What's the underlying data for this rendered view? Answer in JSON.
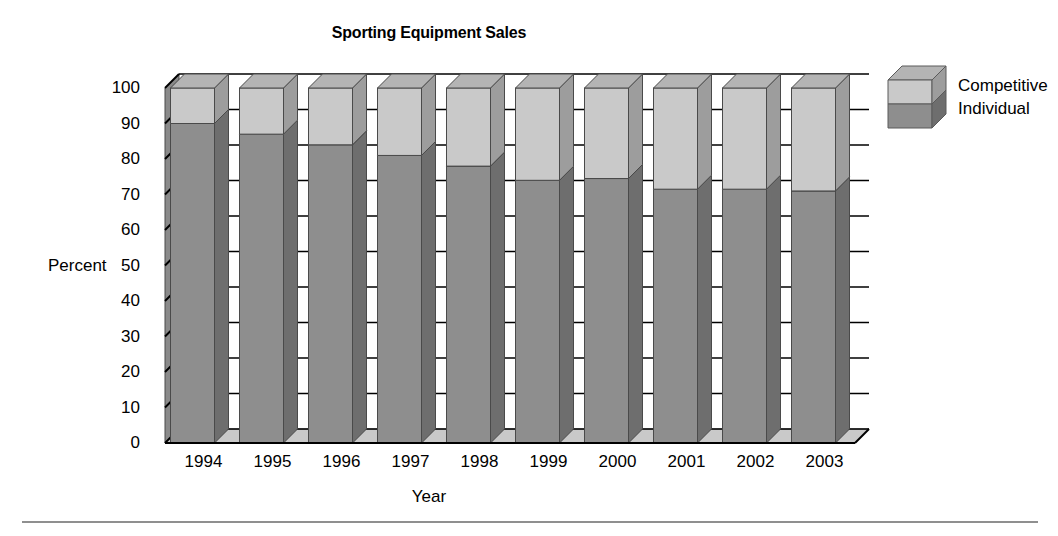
{
  "chart_data": {
    "type": "bar",
    "subtype": "stacked-100-percent-3d-column",
    "title": "Sporting Equipment Sales",
    "xlabel": "Year",
    "ylabel": "Percent",
    "categories": [
      "1994",
      "1995",
      "1996",
      "1997",
      "1998",
      "1999",
      "2000",
      "2001",
      "2002",
      "2003"
    ],
    "series": [
      {
        "name": "Individual",
        "values": [
          90,
          87,
          84,
          81,
          78,
          74,
          74.5,
          71.5,
          71.5,
          71
        ],
        "color": "#8e8e8e",
        "side_color": "#6e6e6e",
        "top_color": "#a6a6a6"
      },
      {
        "name": "Competitive",
        "values": [
          10,
          13,
          16,
          19,
          22,
          26,
          25.5,
          28.5,
          28.5,
          29
        ],
        "color": "#c9c9c9",
        "side_color": "#9d9d9d",
        "top_color": "#b4b4b4"
      }
    ],
    "ylim": [
      0,
      100
    ],
    "yticks": [
      0,
      10,
      20,
      30,
      40,
      50,
      60,
      70,
      80,
      90,
      100
    ],
    "ytick_labels": [
      "0",
      "10",
      "20",
      "30",
      "40",
      "50",
      "60",
      "70",
      "80",
      "90",
      "100"
    ],
    "grid": true,
    "grid_color": "#000000",
    "legend": {
      "position": "right-top",
      "entries": [
        "Competitive",
        "Individual"
      ]
    },
    "stack_total": 100,
    "axis_wall_color": "#8a8a8a",
    "floor_color": "#c9c9c9",
    "background": "#ffffff"
  },
  "legend": {
    "entries": [
      {
        "label": "Competitive",
        "swatch": "legend-cube-top-segment"
      },
      {
        "label": "Individual",
        "swatch": "legend-cube-bottom-segment"
      }
    ]
  },
  "footer": {
    "rule": "horizontal-divider"
  }
}
